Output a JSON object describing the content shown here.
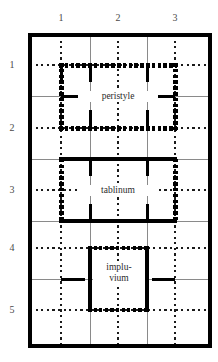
{
  "figure": {
    "type": "architectural-floor-plan",
    "background_color": "#ffffff",
    "wall_color": "#000000",
    "grid_line_color": "#808080",
    "dotted_guide_color": "#1a1a1a",
    "label_color": "#4a4a4a"
  },
  "axes": {
    "column_labels": [
      "1",
      "2",
      "3"
    ],
    "column_positions_px": [
      61,
      118,
      175
    ],
    "row_labels": [
      "1",
      "2",
      "3",
      "4",
      "5"
    ],
    "row_positions_px": [
      65,
      128,
      190,
      248,
      310
    ]
  },
  "frame": {
    "x": 28,
    "y": 33,
    "width": 184,
    "height": 315,
    "stroke_width": 4
  },
  "rooms": [
    {
      "name": "peristyle",
      "label": "peristyle",
      "label_x": 118,
      "label_y": 96,
      "x": 61,
      "y": 65,
      "width": 114,
      "height": 63,
      "top_wall": "colonnade",
      "bottom_wall": "colonnade",
      "left_wall": "colonnade",
      "right_wall": "colonnade"
    },
    {
      "name": "tablinum",
      "label": "tablinum",
      "label_x": 118,
      "label_y": 190,
      "x": 61,
      "y": 159,
      "width": 114,
      "height": 62,
      "top_wall": "solid",
      "bottom_wall": "solid",
      "left_wall": "colonnade",
      "right_wall": "colonnade"
    },
    {
      "name": "impluvium",
      "label_line1": "implu-",
      "label_line2": "vium",
      "label_x": 118,
      "label_y": 273,
      "x": 90,
      "y": 248,
      "width": 57,
      "height": 62,
      "top_wall": "colonnade",
      "bottom_wall": "colonnade",
      "left_wall": "solid",
      "right_wall": "solid"
    }
  ],
  "grid": {
    "thin_horizontal_y": [
      96,
      159,
      221,
      279
    ],
    "thin_vertical_x": [
      90,
      147
    ],
    "thick_horizontal_y": [
      159,
      221
    ],
    "dotted_vertical_x": [
      61,
      118,
      175
    ],
    "dotted_horizontal_y": [
      65,
      128,
      190,
      248,
      310
    ]
  },
  "wall_stubs": {
    "description": "short thick wall segments projecting from grid intersections",
    "count": 16
  }
}
